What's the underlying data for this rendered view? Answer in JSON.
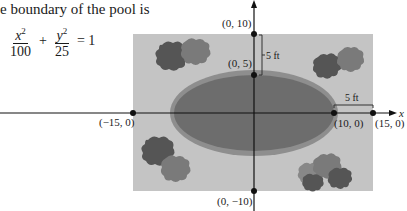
{
  "intro": {
    "text": "e boundary of the pool is"
  },
  "equation": {
    "term1_num": "x",
    "term1_exp": "2",
    "term1_den": "100",
    "plus": "+",
    "term2_num": "y",
    "term2_exp": "2",
    "term2_den": "25",
    "equals": "= 1"
  },
  "figure": {
    "colors": {
      "yard": "#c4c4c4",
      "pool_border": "#8e8e8e",
      "pool_water": "#6d6d6d",
      "bush_dark": "#555555",
      "bush_mid": "#777777",
      "axis": "#111111"
    },
    "points": {
      "top": "(0, 10)",
      "pool_top": "(0, 5)",
      "left": "(−15, 0)",
      "pool_right": "(10, 0)",
      "right": "(15, 0)",
      "bottom": "(0, −10)"
    },
    "dimensions": {
      "vertical_gap": "5 ft",
      "horizontal_gap": "5 ft"
    },
    "axis_labels": {
      "x": "x"
    }
  }
}
